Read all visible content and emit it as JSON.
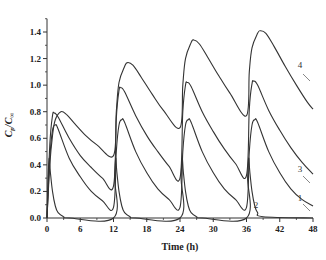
{
  "chart_data": {
    "type": "line",
    "title": "",
    "xlabel": "Time (h)",
    "ylabel": "Cp/C∞",
    "xlim": [
      0,
      48
    ],
    "ylim": [
      0,
      1.5
    ],
    "xticks": [
      0,
      6,
      12,
      18,
      24,
      30,
      36,
      42,
      48
    ],
    "yticks": [
      0.0,
      0.2,
      0.4,
      0.6,
      0.8,
      1.0,
      1.2,
      1.4
    ],
    "xtick_labels": [
      "0",
      "6",
      "12",
      "18",
      "24",
      "30",
      "36",
      "42",
      "48"
    ],
    "ytick_labels": [
      "0.0",
      "0.2",
      "0.4",
      "0.6",
      "0.8",
      "1.0",
      "1.2",
      "1.4"
    ],
    "grid": false,
    "legend": "inline curve labels at right end",
    "dosing_interval_h": 12,
    "series": [
      {
        "name": "1",
        "points": [
          [
            0,
            0
          ],
          [
            0.5,
            0.45
          ],
          [
            1.0,
            0.66
          ],
          [
            1.5,
            0.7
          ],
          [
            2,
            0.67
          ],
          [
            4,
            0.45
          ],
          [
            6,
            0.31
          ],
          [
            8,
            0.2
          ],
          [
            10,
            0.13
          ],
          [
            12,
            0.08
          ],
          [
            12.5,
            0.5
          ],
          [
            13,
            0.7
          ],
          [
            13.5,
            0.74
          ],
          [
            14,
            0.72
          ],
          [
            16,
            0.5
          ],
          [
            18,
            0.34
          ],
          [
            20,
            0.22
          ],
          [
            22,
            0.14
          ],
          [
            24,
            0.08
          ],
          [
            24.5,
            0.5
          ],
          [
            25,
            0.7
          ],
          [
            25.5,
            0.74
          ],
          [
            26,
            0.72
          ],
          [
            28,
            0.5
          ],
          [
            30,
            0.34
          ],
          [
            32,
            0.22
          ],
          [
            34,
            0.14
          ],
          [
            36,
            0.08
          ],
          [
            36.5,
            0.5
          ],
          [
            37,
            0.7
          ],
          [
            37.5,
            0.74
          ],
          [
            38,
            0.72
          ],
          [
            40,
            0.5
          ],
          [
            42,
            0.34
          ],
          [
            44,
            0.22
          ],
          [
            46,
            0.14
          ],
          [
            48,
            0.09
          ]
        ]
      },
      {
        "name": "2",
        "points": [
          [
            0,
            0
          ],
          [
            0.2,
            0.3
          ],
          [
            0.4,
            0.45
          ],
          [
            0.6,
            0.35
          ],
          [
            1,
            0.2
          ],
          [
            1.5,
            0.09
          ],
          [
            2,
            0.04
          ],
          [
            3,
            0.01
          ],
          [
            4,
            0
          ],
          [
            12,
            0
          ],
          [
            12.2,
            0.3
          ],
          [
            12.4,
            0.45
          ],
          [
            12.6,
            0.35
          ],
          [
            13,
            0.2
          ],
          [
            13.5,
            0.09
          ],
          [
            14,
            0.04
          ],
          [
            15,
            0.01
          ],
          [
            16,
            0
          ],
          [
            24,
            0
          ],
          [
            24.2,
            0.3
          ],
          [
            24.4,
            0.45
          ],
          [
            24.6,
            0.35
          ],
          [
            25,
            0.2
          ],
          [
            25.5,
            0.09
          ],
          [
            26,
            0.04
          ],
          [
            27,
            0.01
          ],
          [
            28,
            0
          ],
          [
            36,
            0
          ],
          [
            36.2,
            0.3
          ],
          [
            36.4,
            0.45
          ],
          [
            36.6,
            0.35
          ],
          [
            37,
            0.2
          ],
          [
            37.5,
            0.09
          ],
          [
            38,
            0.04
          ],
          [
            39,
            0.01
          ],
          [
            48,
            0
          ]
        ]
      },
      {
        "name": "3",
        "points": [
          [
            0,
            0
          ],
          [
            0.5,
            0.55
          ],
          [
            1,
            0.77
          ],
          [
            1.3,
            0.79
          ],
          [
            2,
            0.76
          ],
          [
            4,
            0.6
          ],
          [
            6,
            0.47
          ],
          [
            8,
            0.38
          ],
          [
            10,
            0.3
          ],
          [
            12,
            0.24
          ],
          [
            12.5,
            0.75
          ],
          [
            13,
            0.96
          ],
          [
            13.3,
            0.98
          ],
          [
            14,
            0.95
          ],
          [
            16,
            0.77
          ],
          [
            18,
            0.62
          ],
          [
            20,
            0.5
          ],
          [
            22,
            0.39
          ],
          [
            24,
            0.3
          ],
          [
            24.5,
            0.8
          ],
          [
            25,
            1.0
          ],
          [
            25.3,
            1.02
          ],
          [
            26,
            0.99
          ],
          [
            28,
            0.8
          ],
          [
            30,
            0.65
          ],
          [
            32,
            0.52
          ],
          [
            34,
            0.41
          ],
          [
            36,
            0.32
          ],
          [
            36.5,
            0.82
          ],
          [
            37,
            1.01
          ],
          [
            37.3,
            1.03
          ],
          [
            38,
            1.0
          ],
          [
            40,
            0.81
          ],
          [
            42,
            0.66
          ],
          [
            44,
            0.53
          ],
          [
            46,
            0.42
          ],
          [
            48,
            0.33
          ]
        ]
      },
      {
        "name": "4",
        "points": [
          [
            0,
            0
          ],
          [
            0.5,
            0.4
          ],
          [
            1,
            0.62
          ],
          [
            1.5,
            0.74
          ],
          [
            2.5,
            0.8
          ],
          [
            3.5,
            0.78
          ],
          [
            5,
            0.71
          ],
          [
            7,
            0.62
          ],
          [
            9,
            0.55
          ],
          [
            12,
            0.47
          ],
          [
            12.5,
            0.8
          ],
          [
            13,
            1.02
          ],
          [
            14,
            1.14
          ],
          [
            14.5,
            1.17
          ],
          [
            15.5,
            1.15
          ],
          [
            17,
            1.06
          ],
          [
            19,
            0.93
          ],
          [
            21,
            0.81
          ],
          [
            24,
            0.68
          ],
          [
            24.5,
            1.0
          ],
          [
            25,
            1.2
          ],
          [
            26,
            1.32
          ],
          [
            26.5,
            1.34
          ],
          [
            27.5,
            1.31
          ],
          [
            29,
            1.21
          ],
          [
            31,
            1.07
          ],
          [
            33,
            0.94
          ],
          [
            36,
            0.77
          ],
          [
            36.5,
            1.1
          ],
          [
            37,
            1.28
          ],
          [
            38,
            1.39
          ],
          [
            38.5,
            1.41
          ],
          [
            39.5,
            1.39
          ],
          [
            41,
            1.29
          ],
          [
            43,
            1.14
          ],
          [
            45,
            1.0
          ],
          [
            47,
            0.87
          ],
          [
            48,
            0.82
          ]
        ]
      }
    ]
  }
}
